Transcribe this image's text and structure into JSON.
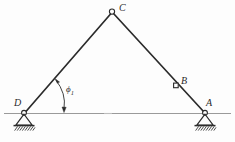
{
  "figure": {
    "background_color": "#fdfdfd",
    "line_color": "#2b2b2b",
    "ground_line_color": "#9a9a9a",
    "labels": {
      "apex": "C",
      "left_support": "D",
      "right_support": "A",
      "right_member_point": "B",
      "angle": "ϕ",
      "angle_subscript": "1"
    },
    "nodes": [
      {
        "name": "C",
        "marker": "open-circle",
        "x": 112,
        "y": 12
      },
      {
        "name": "D",
        "marker": "open-circle",
        "x": 24,
        "y": 113
      },
      {
        "name": "A",
        "marker": "open-circle",
        "x": 205,
        "y": 113
      },
      {
        "name": "B",
        "marker": "open-square",
        "x": 176,
        "y": 85
      }
    ],
    "members": [
      {
        "name": "member-DC",
        "from": "D",
        "to": "C"
      },
      {
        "name": "member-CA",
        "from": "C",
        "to": "A"
      }
    ],
    "supports": [
      {
        "name": "support-D",
        "type": "pinned-hatched",
        "x": 24,
        "y": 113
      },
      {
        "name": "support-A",
        "type": "pinned-hatched",
        "x": 205,
        "y": 113
      }
    ],
    "ground_line": {
      "x1": 4,
      "x2": 231,
      "y": 113
    },
    "angle_arc": {
      "name": "angle-phi1",
      "vertex_x": 24,
      "vertex_y": 113,
      "from_member": "member-DC",
      "to_reference": "ground_line",
      "double_arrow": true
    }
  }
}
